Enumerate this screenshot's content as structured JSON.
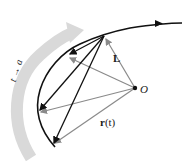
{
  "diagram": {
    "labels": {
      "tangent_limit": "L",
      "origin": "O",
      "position_vector_bold": "r",
      "position_vector_arg": "(t)",
      "limit_arrow": "t → a"
    },
    "colors": {
      "curve": "#111111",
      "chords": "#111111",
      "position_vectors": "#8a8a8a",
      "limit_arrow_band": "#d9d9d9",
      "background": "#ffffff"
    },
    "points": {
      "origin": [
        135,
        88
      ],
      "limit_point": [
        104,
        36
      ],
      "curve_points": [
        [
          68,
          54
        ],
        [
          38,
          112
        ],
        [
          52,
          145
        ]
      ]
    }
  }
}
